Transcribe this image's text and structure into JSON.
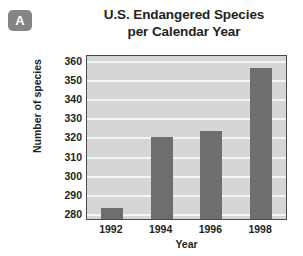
{
  "badge": {
    "label": "A"
  },
  "chart_data": {
    "type": "bar",
    "title": "U.S. Endangered Species per Calendar Year",
    "title_line1": "U.S. Endangered Species",
    "title_line2": "per Calendar Year",
    "xlabel": "Year",
    "ylabel": "Number of species",
    "categories": [
      "1992",
      "1994",
      "1996",
      "1998"
    ],
    "values": [
      284,
      321,
      324,
      357
    ],
    "ylim": [
      278,
      363
    ],
    "yticks": [
      280,
      290,
      300,
      310,
      320,
      330,
      340,
      350,
      360
    ],
    "ytick_labels": [
      "280",
      "290",
      "300",
      "310",
      "320",
      "330",
      "340",
      "350",
      "360"
    ],
    "grid": true,
    "legend": null,
    "colors": {
      "bar": "#6e6e6e",
      "plot_background": "#d6d6d6",
      "gridline": "#f5f5f5",
      "axis_border": "#4a4a4a",
      "text": "#231f20",
      "badge_background": "#858585",
      "badge_text": "#ffffff"
    }
  }
}
